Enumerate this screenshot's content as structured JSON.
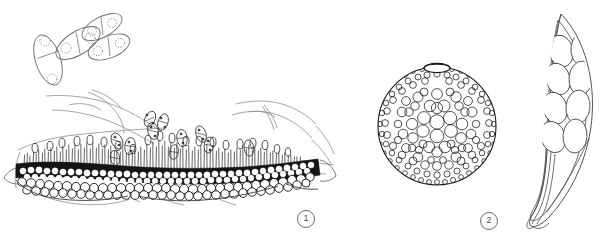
{
  "plate": {
    "title": "Fungal morphology plate",
    "background_color": "#ffffff",
    "width": 615,
    "height": 238,
    "ink_dark": "#1a1a1a",
    "ink_mid": "#555555",
    "ink_light": "#8d8d8d"
  },
  "labels": [
    {
      "id": "label-1",
      "text": "1",
      "x": 297,
      "y": 210
    },
    {
      "id": "label-2",
      "text": "2",
      "x": 480,
      "y": 212
    }
  ],
  "panels": [
    {
      "number": "1",
      "name": "acervulus-cross-section",
      "description": "Cross-section through host tissue showing a dark stroma of pseudoparenchymatous cells bearing a dense palisade of conidiophores, with ruptured host epidermis and released two-celled conidia",
      "elements": {
        "free_conidia_large_count": 4,
        "free_conidia_small_count": 11,
        "conidium_septa": 1,
        "conidium_cells": 2,
        "nuclei_per_cell": 1,
        "stroma_cell_rows": 3,
        "conidiophore_count": 96,
        "host_epidermis_flaps": 2
      }
    },
    {
      "number": "2",
      "name": "pycnidium",
      "description": "Globose pycnidium in surface view with a papillate ostiole at the apex and a wall of textura angularis cells",
      "elements": {
        "ostiole": true,
        "shape": "globose",
        "wall_cell_count_approx": 430,
        "diameter_px": 118
      }
    },
    {
      "number": "3",
      "name": "ascus-with-ascospores",
      "description": "Clavate bitunicate ascus with a long tapering pedicel containing eight biseriate ellipsoid ascospores",
      "elements": {
        "ascospore_count": 8,
        "ascospore_arrangement": "biseriate",
        "ascus_shape": "clavate",
        "pedicel": "long tapering",
        "wall_layers": 2
      }
    }
  ]
}
